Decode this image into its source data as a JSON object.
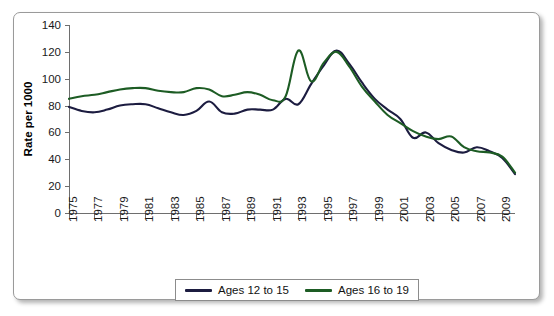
{
  "chart_data": {
    "type": "line",
    "title": "",
    "xlabel": "",
    "ylabel": "Rate per 1000",
    "xlim": [
      1975,
      2010
    ],
    "ylim": [
      0,
      140
    ],
    "yticks": [
      0,
      20,
      40,
      60,
      80,
      100,
      120,
      140
    ],
    "xticks": [
      1975,
      1977,
      1979,
      1981,
      1983,
      1985,
      1987,
      1989,
      1991,
      1993,
      1995,
      1997,
      1999,
      2001,
      2003,
      2005,
      2007,
      2009
    ],
    "grid": false,
    "legend_position": "bottom-center",
    "x": [
      1975,
      1976,
      1977,
      1978,
      1979,
      1980,
      1981,
      1982,
      1983,
      1984,
      1985,
      1986,
      1987,
      1988,
      1989,
      1990,
      1991,
      1992,
      1993,
      1994,
      1995,
      1996,
      1997,
      1998,
      1999,
      2000,
      2001,
      2002,
      2003,
      2004,
      2005,
      2006,
      2007,
      2008,
      2009,
      2010
    ],
    "series": [
      {
        "name": "Ages 12 to 15",
        "color": "#1c1c40",
        "values": [
          79,
          76,
          75,
          77,
          80,
          81,
          81,
          78,
          75,
          73,
          76,
          83,
          75,
          74,
          77,
          77,
          77,
          85,
          81,
          96,
          110,
          121,
          111,
          97,
          85,
          77,
          70,
          56,
          60,
          52,
          47,
          45,
          49,
          46,
          41,
          29
        ]
      },
      {
        "name": "Ages 16 to 19",
        "color": "#1d5c24",
        "values": [
          85,
          87,
          88,
          90,
          92,
          93,
          93,
          91,
          90,
          90,
          93,
          92,
          87,
          88,
          90,
          88,
          84,
          87,
          121,
          98,
          112,
          120,
          109,
          94,
          83,
          73,
          67,
          61,
          57,
          55,
          57,
          49,
          46,
          45,
          42,
          30
        ]
      }
    ],
    "legend": [
      {
        "label": "Ages 12 to 15",
        "color": "#1c1c40"
      },
      {
        "label": "Ages 16 to 19",
        "color": "#1d5c24"
      }
    ]
  },
  "geometry": {
    "plot_left": 55,
    "plot_right": 501,
    "plot_top": 12,
    "plot_bottom": 200
  }
}
